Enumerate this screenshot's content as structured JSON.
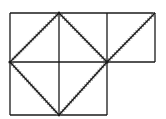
{
  "diagram": {
    "colors": {
      "stroke": "#1a1a1a",
      "hatch": "#8a8a8a",
      "background": "#ffffff"
    },
    "grid": {
      "top_row": {
        "cells": 3
      },
      "bottom_row": {
        "cells": 2
      }
    },
    "diagonals": [
      {
        "from": "top-middle-of-left-block",
        "to": "left-mid"
      },
      {
        "from": "left-mid",
        "to": "bottom-middle"
      },
      {
        "from": "bottom-middle",
        "to": "center-right"
      },
      {
        "from": "center-right",
        "to": "top-middle-of-left-block"
      },
      {
        "from": "center-right",
        "to": "top-right"
      }
    ]
  }
}
